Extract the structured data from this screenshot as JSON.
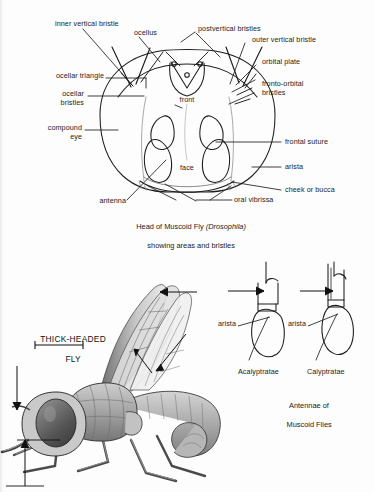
{
  "plate": {
    "title": "Muscoid Fly Anatomy Plate",
    "background_color": "#fdfdfd",
    "ink_color": "#1a1a1a"
  },
  "head_figure": {
    "caption_line1": "Head of Muscoid Fly ",
    "caption_species": "(Drosophila)",
    "caption_line2": "showing areas and bristles",
    "inner_labels": {
      "front": "front",
      "face": "face"
    },
    "labels": [
      {
        "id": "inner-vertical-bristle",
        "text": "inner vertical bristle"
      },
      {
        "id": "ocellus",
        "text": "ocellus"
      },
      {
        "id": "postvertical-bristles",
        "text": "postvertical bristles"
      },
      {
        "id": "outer-vertical-bristle",
        "text": "outer vertical bristle"
      },
      {
        "id": "orbital-plate",
        "text": "orbital plate"
      },
      {
        "id": "ocellar-triangle",
        "text": "ocellar triangle"
      },
      {
        "id": "fronto-orbital-bristles-1",
        "text": "fronto-orbital"
      },
      {
        "id": "fronto-orbital-bristles-2",
        "text": "bristles"
      },
      {
        "id": "ocellar-bristles-1",
        "text": "ocellar"
      },
      {
        "id": "ocellar-bristles-2",
        "text": "bristles"
      },
      {
        "id": "compound-eye-1",
        "text": "compound"
      },
      {
        "id": "compound-eye-2",
        "text": "eye"
      },
      {
        "id": "frontal-suture",
        "text": "frontal suture"
      },
      {
        "id": "arista",
        "text": "arista"
      },
      {
        "id": "cheek-or-bucca",
        "text": "cheek or bucca"
      },
      {
        "id": "antenna",
        "text": "antenna"
      },
      {
        "id": "oral-vibrissa",
        "text": "oral vibrissa"
      }
    ]
  },
  "fly_figure": {
    "title_line1": "THICK-HEADED",
    "title_line2": "FLY"
  },
  "antennae_figure": {
    "left_name": "Acalyptratae",
    "right_name": "Calyptratae",
    "left_arista": "arista",
    "right_arista": "arista",
    "caption_line1": "Antennae of",
    "caption_line2": "Muscoid Flies"
  }
}
